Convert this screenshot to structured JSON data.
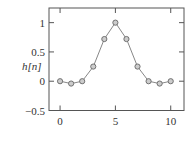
{
  "chart_data": {
    "type": "line",
    "title": "",
    "xlabel": "",
    "ylabel": "h[n]",
    "x": [
      0,
      1,
      2,
      3,
      4,
      5,
      6,
      7,
      8,
      9,
      10
    ],
    "series": [
      {
        "name": "h[n]",
        "values": [
          0,
          -0.04,
          0,
          0.25,
          0.72,
          1.0,
          0.72,
          0.25,
          0,
          -0.04,
          0
        ],
        "marker": "circle",
        "color": "#777777"
      }
    ],
    "xlim": [
      -1,
      11.2
    ],
    "ylim": [
      -0.5,
      1.25
    ],
    "xticks": [
      0,
      5,
      10
    ],
    "xtick_labels": [
      "0",
      "5",
      "10"
    ],
    "yticks": [
      -0.5,
      0,
      0.5,
      1
    ],
    "ytick_labels": [
      "−0.5",
      "0",
      "0.5",
      "1"
    ],
    "grid": false,
    "legend": null
  }
}
